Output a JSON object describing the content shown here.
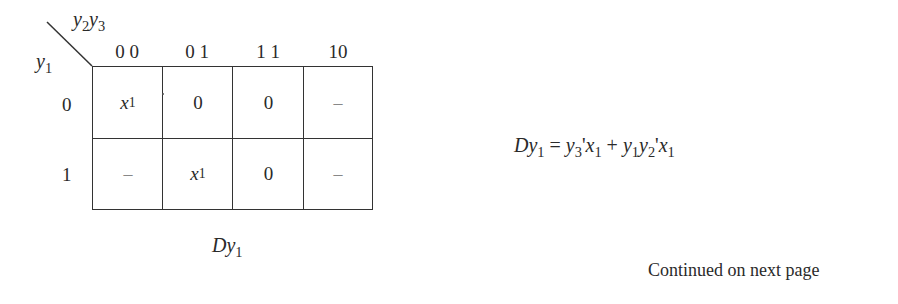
{
  "kmap": {
    "top_variables": {
      "base1": "y",
      "sub1": "2",
      "base2": "y",
      "sub2": "3"
    },
    "left_variable": {
      "base": "y",
      "sub": "1"
    },
    "column_headers": [
      "0 0",
      "0 1",
      "1 1",
      "10"
    ],
    "row_headers": [
      "0",
      "1"
    ],
    "cells": [
      [
        {
          "base": "x",
          "sub": "1",
          "type": "var"
        },
        {
          "text": "0",
          "type": "val"
        },
        {
          "text": "0",
          "type": "val"
        },
        {
          "text": "–",
          "type": "dontcare"
        }
      ],
      [
        {
          "text": "–",
          "type": "dontcare"
        },
        {
          "base": "x",
          "sub": "1",
          "type": "var"
        },
        {
          "text": "0",
          "type": "val"
        },
        {
          "text": "–",
          "type": "dontcare"
        }
      ]
    ],
    "caption": {
      "base": "Dy",
      "sub": "1"
    }
  },
  "equation": {
    "lhs": {
      "base": "Dy",
      "sub": "1"
    },
    "eq": "=",
    "t1a": {
      "base": "y",
      "sub": "3",
      "post": "'"
    },
    "t1b": {
      "base": "x",
      "sub": "1"
    },
    "plus": "+",
    "t2a": {
      "base": "y",
      "sub": "1"
    },
    "t2b": {
      "base": "y",
      "sub": "2",
      "post": "'"
    },
    "t2c": {
      "base": "x",
      "sub": "1"
    }
  },
  "footer": {
    "text": "Continued on next page"
  }
}
